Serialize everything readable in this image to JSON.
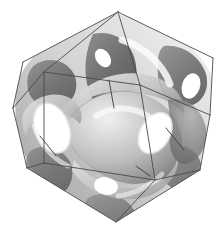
{
  "figure": {
    "title": "Triply periodic minimal surface in a cubic unit cell",
    "render_style": "grayscale-shaded-3d",
    "background_color": "#ffffff",
    "canvas": {
      "width": 224,
      "height": 233
    }
  },
  "wireframe": {
    "shape": "cube",
    "line_color": "#4a4a4a",
    "line_width": 0.9,
    "projection": "near-body-diagonal",
    "vertices": {
      "top": {
        "x": 118,
        "y": 12,
        "label": "v-top"
      },
      "upper_left": {
        "x": 23,
        "y": 62,
        "label": "v-upper-left"
      },
      "upper_right": {
        "x": 213,
        "y": 58,
        "label": "v-upper-right"
      },
      "left": {
        "x": 13,
        "y": 108,
        "label": "v-left"
      },
      "right": {
        "x": 210,
        "y": 115,
        "label": "v-right"
      },
      "inner_upper": {
        "x": 140,
        "y": 85,
        "label": "v-inner-upper"
      },
      "inner_left": {
        "x": 44,
        "y": 72,
        "label": "v-inner-left"
      },
      "inner_lower": {
        "x": 44,
        "y": 163,
        "label": "v-inner-lower"
      },
      "inner_right": {
        "x": 155,
        "y": 180,
        "label": "v-inner-right"
      },
      "lower_left": {
        "x": 27,
        "y": 168,
        "label": "v-lower-left"
      },
      "lower_right": {
        "x": 200,
        "y": 170,
        "label": "v-lower-right"
      },
      "bottom": {
        "x": 116,
        "y": 222,
        "label": "v-bottom"
      }
    },
    "edges": [
      [
        "top",
        "upper_left"
      ],
      [
        "top",
        "upper_right"
      ],
      [
        "top",
        "inner_upper"
      ],
      [
        "top",
        "inner_left"
      ],
      [
        "upper_left",
        "left"
      ],
      [
        "upper_right",
        "right"
      ],
      [
        "left",
        "inner_left"
      ],
      [
        "left",
        "lower_left"
      ],
      [
        "right",
        "inner_upper"
      ],
      [
        "right",
        "lower_right"
      ],
      [
        "inner_left",
        "inner_lower"
      ],
      [
        "inner_left",
        "inner_upper"
      ],
      [
        "inner_upper",
        "inner_right"
      ],
      [
        "inner_lower",
        "lower_left"
      ],
      [
        "inner_lower",
        "inner_right"
      ],
      [
        "lower_left",
        "bottom"
      ],
      [
        "lower_right",
        "bottom"
      ],
      [
        "inner_right",
        "bottom"
      ],
      [
        "inner_right",
        "lower_right"
      ]
    ]
  },
  "surface": {
    "description": "Smooth saddle sheets passing through cube faces, forming circular necks at face centers",
    "shading": {
      "dark": "#646464",
      "mid_dark": "#8f8f8f",
      "mid": "#b4b4b4",
      "light": "#d8d8d8",
      "highlight": "#f2f2f2",
      "edge_stroke": "#7a7a7a"
    },
    "light_direction": "upper-right",
    "holes": [
      {
        "name": "hole-left",
        "cx": 52,
        "cy": 128,
        "rx": 17,
        "ry": 26,
        "rot": -22
      },
      {
        "name": "hole-center-right",
        "cx": 155,
        "cy": 133,
        "rx": 15,
        "ry": 22,
        "rot": 30
      },
      {
        "name": "hole-upper-right",
        "cx": 191,
        "cy": 86,
        "rx": 9,
        "ry": 13,
        "rot": 18
      },
      {
        "name": "hole-top",
        "cx": 103,
        "cy": 58,
        "rx": 7,
        "ry": 10,
        "rot": -35
      },
      {
        "name": "hole-bottom",
        "cx": 106,
        "cy": 186,
        "rx": 12,
        "ry": 9,
        "rot": 10
      }
    ],
    "lobe_count": 6,
    "symmetry": "cubic"
  }
}
